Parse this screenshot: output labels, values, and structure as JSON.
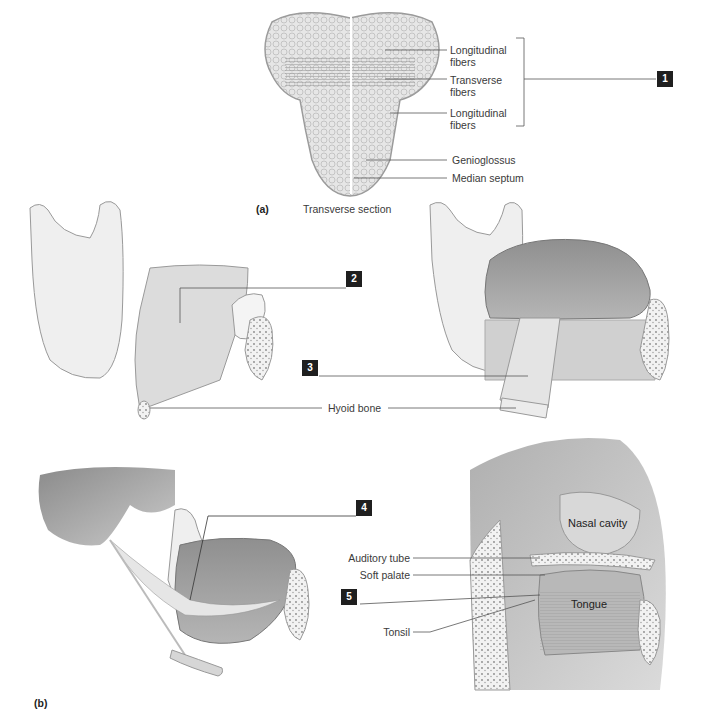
{
  "figure": {
    "part_a": {
      "label": "(a)",
      "caption": "Transverse section",
      "labels": [
        {
          "id": "longitudinal_upper",
          "line1": "Longitudinal",
          "line2": "fibers"
        },
        {
          "id": "transverse",
          "line1": "Transverse",
          "line2": "fibers"
        },
        {
          "id": "longitudinal_lower",
          "line1": "Longitudinal",
          "line2": "fibers"
        },
        {
          "id": "genioglossus",
          "text": "Genioglossus"
        },
        {
          "id": "median_septum",
          "text": "Median septum"
        }
      ],
      "bracket_callout": "1"
    },
    "middle_panels": {
      "left_callout": "2",
      "right_callout": "3",
      "hyoid_label": "Hyoid bone"
    },
    "part_b": {
      "label": "(b)",
      "left_callout": "4",
      "right_panel": {
        "labels": {
          "auditory_tube": "Auditory tube",
          "soft_palate": "Soft palate",
          "tonsil": "Tonsil",
          "nasal_cavity": "Nasal cavity",
          "tongue": "Tongue"
        },
        "callout": "5"
      }
    },
    "colors": {
      "callout_box": "#1f1f1f",
      "callout_text": "#ffffff",
      "leader_line": "#555555",
      "muscle": "#d9d9d9",
      "tongue": "#9a9a9a",
      "bone": "#ececec"
    }
  }
}
